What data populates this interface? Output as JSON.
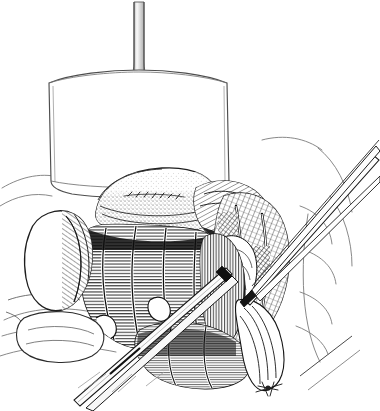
{
  "figure": {
    "domain": "medical-surgical-line-illustration",
    "background_color": "#ffffff",
    "ink_color": "#1a1a1a",
    "light_ink_color": "#6e6e6e",
    "faint_ink_color": "#b5b5b5",
    "technique": "pen-and-ink line and stipple hatching",
    "width": 380,
    "height": 411
  },
  "elements": {
    "retractor": {
      "name": "liver retractor blade",
      "shaft_label": "retractor shaft",
      "blade_label": "retractor blade"
    },
    "organs": [
      {
        "id": "stomach",
        "label": "stomach antrum",
        "shading": "stipple"
      },
      {
        "id": "duodenum",
        "label": "duodenum",
        "shading": "parallel hatch"
      },
      {
        "id": "gallbladder",
        "label": "gallbladder",
        "shading": "outline and hatch"
      },
      {
        "id": "omentum",
        "label": "omentum / mesentery",
        "shading": "fine hatch"
      },
      {
        "id": "pancreas-bed",
        "label": "dissected retroperitoneal bed",
        "shading": "dense crosshatch"
      },
      {
        "id": "abdominal-wall",
        "label": "abdominal wall contour",
        "shading": "outline"
      }
    ],
    "instruments": [
      {
        "id": "forceps-upper-right",
        "label": "dissecting forceps",
        "entry": "upper right"
      },
      {
        "id": "forceps-lower-left",
        "label": "long tissue forceps",
        "entry": "lower left"
      },
      {
        "id": "scissors-right",
        "label": "dissecting scissors",
        "entry": "right"
      },
      {
        "id": "suture-tie",
        "label": "ligature tie",
        "location": "bottom center"
      }
    ]
  },
  "caption": {
    "number": "",
    "text": ""
  }
}
